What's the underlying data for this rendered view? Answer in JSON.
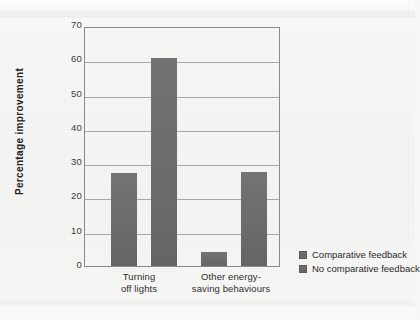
{
  "chart_data": {
    "type": "bar",
    "title": "",
    "subtitle": "",
    "xlabel": "",
    "ylabel": "Percentage  improvement",
    "ylim": [
      0,
      70
    ],
    "yticks": [
      0,
      10,
      20,
      30,
      40,
      50,
      60,
      70
    ],
    "ytick_labels": [
      "0",
      "10",
      "20",
      "30",
      "40",
      "50",
      "60",
      "70"
    ],
    "grid": "horizontal",
    "legend_position": "right",
    "categories": [
      "Turning\noff lights",
      "Other energy-\nsaving behaviours"
    ],
    "category_lines": [
      [
        "Turning",
        "off lights"
      ],
      [
        "Other energy-",
        "saving behaviours"
      ]
    ],
    "series": [
      {
        "name": "Comparative feedback",
        "values": [
          27.0,
          4.0
        ],
        "color": "#6b6b6b"
      },
      {
        "name": "No comparative feedback",
        "values": [
          60.7,
          27.4
        ],
        "color": "#6b6b6b"
      }
    ],
    "bars": [
      {
        "category": "Turning off lights",
        "series": "Comparative feedback",
        "value": 27.0
      },
      {
        "category": "Turning off lights",
        "series": "No comparative feedback",
        "value": 60.7
      },
      {
        "category": "Other energy-saving behaviours",
        "series": "Comparative feedback",
        "value": 4.0
      },
      {
        "category": "Other energy-saving behaviours",
        "series": "No comparative feedback",
        "value": 27.4
      }
    ],
    "colors": {
      "bar": "#6b6b6b",
      "axis": "#8a8a8a",
      "gridline": "#9a9a9a",
      "text": "#2b2b2b",
      "background": "#f6f6f4"
    }
  }
}
